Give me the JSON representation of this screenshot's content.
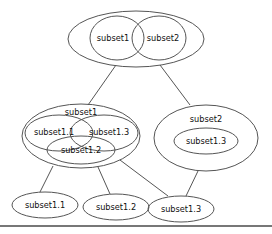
{
  "diagram": {
    "type": "venn-tree",
    "stroke_color": "#555555",
    "text_color": "#111111",
    "background_color": "#ffffff",
    "nodes": [
      {
        "id": "root",
        "kind": "group",
        "outer": {
          "cx": 136,
          "cy": 39,
          "rx": 68,
          "ry": 28
        },
        "members": [
          {
            "label": "subset1",
            "cx": 117,
            "cy": 38,
            "rx": 27,
            "ry": 22,
            "label_x": 113,
            "label_y": 38
          },
          {
            "label": "subset2",
            "cx": 159,
            "cy": 38,
            "rx": 27,
            "ry": 22,
            "label_x": 163,
            "label_y": 38
          }
        ]
      },
      {
        "id": "mid-left",
        "kind": "group",
        "title": "subset1",
        "title_x": 81,
        "title_y": 112,
        "outer": {
          "cx": 81,
          "cy": 136,
          "rx": 59,
          "ry": 32
        },
        "members": [
          {
            "label": "subset1.1",
            "cx": 59,
            "cy": 133,
            "rx": 34,
            "ry": 18,
            "label_x": 54,
            "label_y": 132
          },
          {
            "label": "subset1.3",
            "cx": 104,
            "cy": 133,
            "rx": 34,
            "ry": 18,
            "label_x": 109,
            "label_y": 132
          },
          {
            "label": "subset1.2",
            "cx": 81,
            "cy": 150,
            "rx": 34,
            "ry": 14,
            "label_x": 81,
            "label_y": 150
          }
        ]
      },
      {
        "id": "mid-right",
        "kind": "group",
        "title": "subset2",
        "title_x": 206,
        "title_y": 119,
        "outer": {
          "cx": 206,
          "cy": 138,
          "rx": 52,
          "ry": 33
        },
        "members": [
          {
            "label": "subset1.3",
            "cx": 206,
            "cy": 141,
            "rx": 32,
            "ry": 13,
            "label_x": 206,
            "label_y": 141
          }
        ]
      },
      {
        "id": "leaf-1",
        "kind": "leaf",
        "label": "subset1.1",
        "outer": {
          "cx": 45,
          "cy": 205,
          "rx": 33,
          "ry": 13
        },
        "label_x": 45,
        "label_y": 205
      },
      {
        "id": "leaf-2",
        "kind": "leaf",
        "label": "subset1.2",
        "outer": {
          "cx": 116,
          "cy": 207,
          "rx": 33,
          "ry": 13
        },
        "label_x": 116,
        "label_y": 207
      },
      {
        "id": "leaf-3",
        "kind": "leaf",
        "label": "subset1.3",
        "outer": {
          "cx": 181,
          "cy": 209,
          "rx": 33,
          "ry": 13
        },
        "label_x": 181,
        "label_y": 209
      }
    ],
    "edges": [
      {
        "from": "root",
        "to": "mid-left",
        "x1": 116,
        "y1": 65,
        "x2": 88,
        "y2": 105
      },
      {
        "from": "root",
        "to": "mid-right",
        "x1": 160,
        "y1": 65,
        "x2": 190,
        "y2": 105
      },
      {
        "from": "mid-left",
        "to": "leaf-1",
        "x1": 53,
        "y1": 166,
        "x2": 40,
        "y2": 192
      },
      {
        "from": "mid-left",
        "to": "leaf-2",
        "x1": 98,
        "y1": 167,
        "x2": 110,
        "y2": 194
      },
      {
        "from": "mid-left",
        "to": "leaf-3",
        "x1": 120,
        "y1": 160,
        "x2": 168,
        "y2": 196
      },
      {
        "from": "mid-right",
        "to": "leaf-3",
        "x1": 198,
        "y1": 171,
        "x2": 186,
        "y2": 196
      }
    ],
    "footer_rule": {
      "x1": 0,
      "y1": 226,
      "x2": 272,
      "y2": 226
    }
  }
}
